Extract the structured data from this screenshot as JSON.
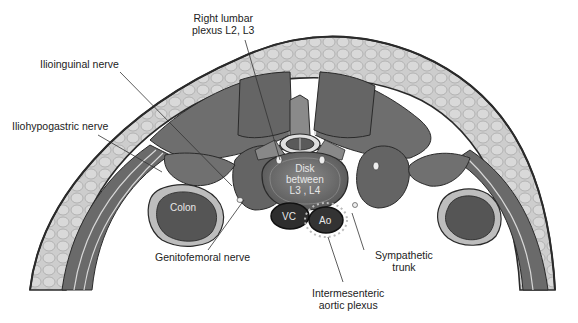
{
  "figure": {
    "colors": {
      "background": "#ffffff",
      "skin_outline": "#2a2a2a",
      "subcutaneous_fat": "#c9c9c9",
      "muscle": "#6e6e6e",
      "muscle_dark": "#5a5a5a",
      "fascia": "#e6e6e6",
      "vessel": "#2e2e2e",
      "disk": "#7a7a7a",
      "leader_line": "#333333",
      "label_text": "#222222"
    }
  },
  "labels": {
    "right_lumbar_plexus": [
      "Right lumbar",
      "plexus L2, L3"
    ],
    "ilioinguinal_nerve": "Ilioinguinal nerve",
    "iliohypogastric_nerve": "Iliohypogastric nerve",
    "genitofemoral_nerve": "Genitofemoral nerve",
    "sympathetic_trunk": [
      "Sympathetic",
      "trunk"
    ],
    "intermesenteric_aortic_plexus": [
      "Intermesenteric",
      "aortic plexus"
    ]
  },
  "structures": {
    "disk": [
      "Disk",
      "between",
      "L3 , L4"
    ],
    "colon": "Colon",
    "vena_cava": "VC",
    "aorta": "Ao"
  }
}
